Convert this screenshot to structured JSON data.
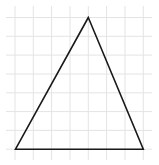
{
  "diagram": {
    "type": "triangle-on-grid",
    "background": "#ffffff",
    "grid": {
      "color": "#e4e4e4",
      "x_lines": [
        15,
        33.3,
        51.6,
        70,
        88.3,
        106.6,
        125,
        143.3
      ],
      "y_lines": [
        17.5,
        36.3,
        55.1,
        74,
        92.8,
        111.6,
        130.4,
        149.2
      ],
      "x_extent": [
        6,
        152
      ],
      "y_extent": [
        6,
        160
      ]
    },
    "triangle": {
      "stroke": "#1a1a1a",
      "stroke_width": 1.6,
      "fill": "none",
      "vertices": [
        {
          "name": "apex",
          "x": 88.3,
          "y": 17.5
        },
        {
          "name": "bottom-left",
          "x": 15.5,
          "y": 149.2
        },
        {
          "name": "bottom-right",
          "x": 143.3,
          "y": 149.2
        }
      ]
    }
  }
}
